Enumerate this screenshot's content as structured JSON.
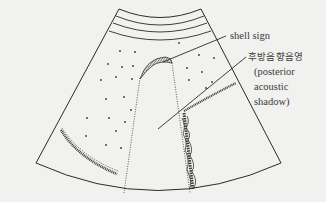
{
  "diagram": {
    "colors": {
      "background": "#f1f1ef",
      "line": "#2a2a2a",
      "text": "#3a3a3a"
    },
    "labels": {
      "shell_sign": "shell sign",
      "shadow_korean": "후방음향음영",
      "shadow_en_line1": "(posterior",
      "shadow_en_line2": "acoustic",
      "shadow_en_line3": "shadow)"
    },
    "elements": [
      "ultrasound-fan-outline",
      "abdominal-wall-layers",
      "gallbladder-shell-echo",
      "posterior-acoustic-shadow",
      "liver-parenchyma-dots",
      "left-curved-echo-band",
      "right-vertical-echo-band",
      "right-oblique-echo-band"
    ]
  }
}
